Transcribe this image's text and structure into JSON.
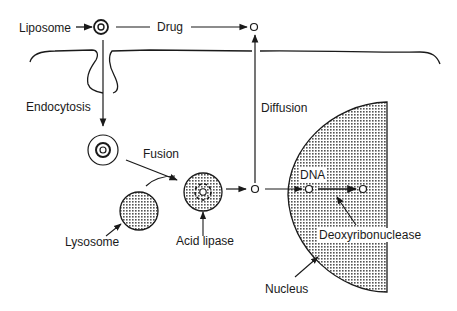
{
  "diagram": {
    "labels": {
      "liposome": "Liposome",
      "drug": "Drug",
      "endocytosis": "Endocytosis",
      "fusion": "Fusion",
      "diffusion": "Diffusion",
      "dna": "DNA",
      "lysosome": "Lysosome",
      "acid_lipase": "Acid lipase",
      "deoxyribonuclease": "Deoxyribonuclease",
      "nucleus": "Nucleus"
    },
    "colors": {
      "ink": "#1a1a1a",
      "stipple": "#9a9a9a",
      "background": "#ffffff"
    }
  }
}
